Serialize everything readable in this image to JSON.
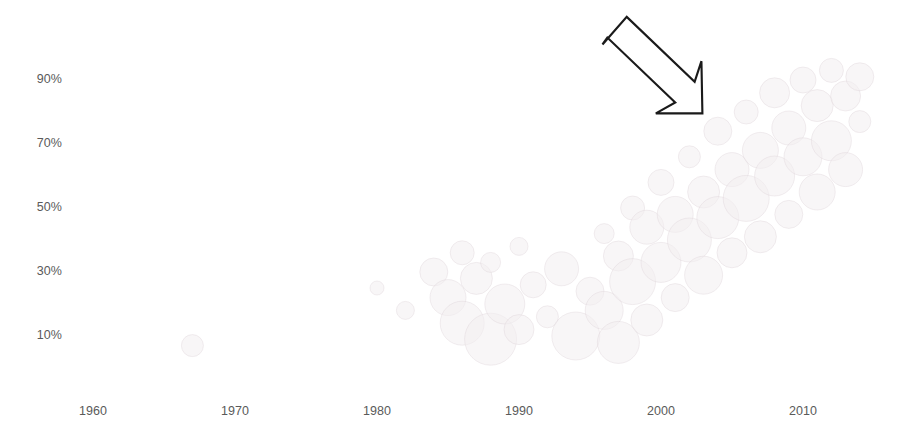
{
  "chart_data": {
    "type": "scatter",
    "title": "",
    "subtitle": "",
    "xlabel": "",
    "ylabel": "",
    "xlim": [
      1955,
      2015
    ],
    "ylim": [
      0,
      100
    ],
    "grid": false,
    "legend": null,
    "x_ticks": [
      "1960",
      "1970",
      "1980",
      "1990",
      "2000",
      "2010"
    ],
    "x_tick_values": [
      1960,
      1970,
      1980,
      1990,
      2000,
      2010
    ],
    "y_ticks": [
      "10%",
      "30%",
      "50%",
      "70%",
      "90%"
    ],
    "y_tick_values": [
      10,
      30,
      50,
      70,
      90
    ],
    "note": "Very low-contrast bubble chart; bubbles are rendered in near-white tints. Density of points increases toward later years and higher percentages.",
    "points": [
      {
        "x": 1967,
        "y": 7,
        "r": 11
      },
      {
        "x": 1980,
        "y": 25,
        "r": 7
      },
      {
        "x": 1982,
        "y": 18,
        "r": 9
      },
      {
        "x": 1984,
        "y": 30,
        "r": 14
      },
      {
        "x": 1985,
        "y": 22,
        "r": 18
      },
      {
        "x": 1986,
        "y": 36,
        "r": 12
      },
      {
        "x": 1986,
        "y": 14,
        "r": 22
      },
      {
        "x": 1987,
        "y": 28,
        "r": 16
      },
      {
        "x": 1988,
        "y": 33,
        "r": 10
      },
      {
        "x": 1988,
        "y": 9,
        "r": 26
      },
      {
        "x": 1989,
        "y": 20,
        "r": 20
      },
      {
        "x": 1990,
        "y": 38,
        "r": 9
      },
      {
        "x": 1990,
        "y": 12,
        "r": 15
      },
      {
        "x": 1991,
        "y": 26,
        "r": 13
      },
      {
        "x": 1992,
        "y": 16,
        "r": 11
      },
      {
        "x": 1993,
        "y": 31,
        "r": 17
      },
      {
        "x": 1994,
        "y": 10,
        "r": 24
      },
      {
        "x": 1995,
        "y": 24,
        "r": 14
      },
      {
        "x": 1996,
        "y": 42,
        "r": 10
      },
      {
        "x": 1996,
        "y": 18,
        "r": 19
      },
      {
        "x": 1997,
        "y": 35,
        "r": 15
      },
      {
        "x": 1997,
        "y": 8,
        "r": 21
      },
      {
        "x": 1998,
        "y": 50,
        "r": 12
      },
      {
        "x": 1998,
        "y": 27,
        "r": 23
      },
      {
        "x": 1999,
        "y": 44,
        "r": 17
      },
      {
        "x": 1999,
        "y": 15,
        "r": 16
      },
      {
        "x": 2000,
        "y": 58,
        "r": 13
      },
      {
        "x": 2000,
        "y": 33,
        "r": 20
      },
      {
        "x": 2001,
        "y": 48,
        "r": 18
      },
      {
        "x": 2001,
        "y": 22,
        "r": 14
      },
      {
        "x": 2002,
        "y": 66,
        "r": 11
      },
      {
        "x": 2002,
        "y": 40,
        "r": 22
      },
      {
        "x": 2003,
        "y": 55,
        "r": 16
      },
      {
        "x": 2003,
        "y": 29,
        "r": 19
      },
      {
        "x": 2004,
        "y": 74,
        "r": 14
      },
      {
        "x": 2004,
        "y": 47,
        "r": 21
      },
      {
        "x": 2005,
        "y": 62,
        "r": 17
      },
      {
        "x": 2005,
        "y": 36,
        "r": 15
      },
      {
        "x": 2006,
        "y": 80,
        "r": 12
      },
      {
        "x": 2006,
        "y": 53,
        "r": 23
      },
      {
        "x": 2007,
        "y": 68,
        "r": 18
      },
      {
        "x": 2007,
        "y": 41,
        "r": 16
      },
      {
        "x": 2008,
        "y": 86,
        "r": 15
      },
      {
        "x": 2008,
        "y": 60,
        "r": 20
      },
      {
        "x": 2009,
        "y": 75,
        "r": 17
      },
      {
        "x": 2009,
        "y": 48,
        "r": 14
      },
      {
        "x": 2010,
        "y": 90,
        "r": 13
      },
      {
        "x": 2010,
        "y": 66,
        "r": 19
      },
      {
        "x": 2011,
        "y": 82,
        "r": 16
      },
      {
        "x": 2011,
        "y": 55,
        "r": 18
      },
      {
        "x": 2012,
        "y": 93,
        "r": 12
      },
      {
        "x": 2012,
        "y": 71,
        "r": 20
      },
      {
        "x": 2013,
        "y": 85,
        "r": 15
      },
      {
        "x": 2013,
        "y": 62,
        "r": 17
      },
      {
        "x": 2014,
        "y": 91,
        "r": 14
      },
      {
        "x": 2014,
        "y": 77,
        "r": 11
      }
    ]
  },
  "annotation": {
    "arrow": {
      "name": "down-right-arrow",
      "direction": "down-right",
      "stroke_color": "#1a1a1a",
      "fill_color": "#ffffff"
    }
  },
  "colors": {
    "background": "#ffffff",
    "tick_label": "#5a5a5a",
    "bubble_tint": "#f2eef0",
    "arrow_stroke": "#1a1a1a"
  }
}
